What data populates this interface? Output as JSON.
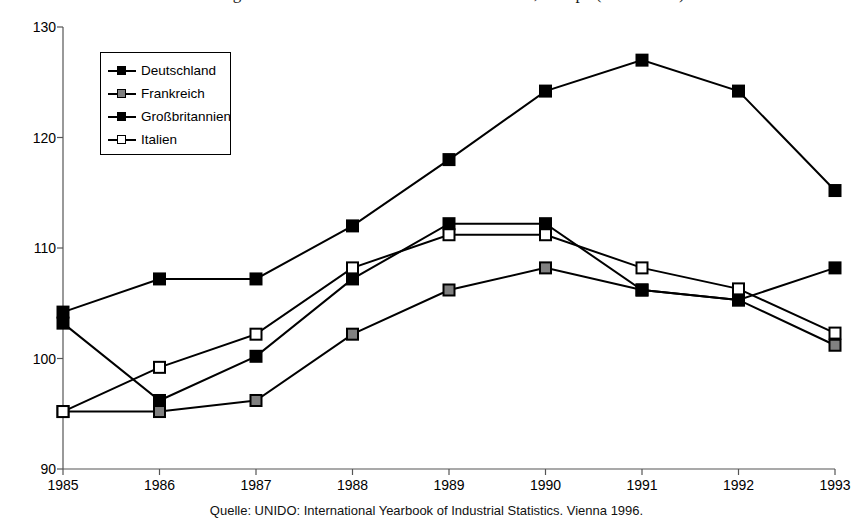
{
  "title": "Abbildung: Lohnstückkosten in der Gesamtwirtschaft, Europa (1985 = 100)",
  "source_note": "Quelle: UNIDO: International Yearbook of Industrial Statistics. Vienna 1996.",
  "legend": {
    "position": "top-left-inside",
    "entries": [
      {
        "label": "Deutschland",
        "marker": "filled-square",
        "color": "#000000"
      },
      {
        "label": "Frankreich",
        "marker": "gray-square",
        "color": "#808080"
      },
      {
        "label": "Großbritannien",
        "marker": "filled-square",
        "color": "#000000"
      },
      {
        "label": "Italien",
        "marker": "open-square",
        "color": "#ffffff"
      }
    ]
  },
  "chart_data": {
    "type": "line",
    "title": "Abbildung: Lohnstückkosten in der Gesamtwirtschaft, Europa (1985 = 100)",
    "xlabel": "",
    "ylabel": "",
    "x": [
      "1985",
      "1986",
      "1987",
      "1988",
      "1989",
      "1990",
      "1991",
      "1992",
      "1993"
    ],
    "categories": [
      "1985",
      "1986",
      "1987",
      "1988",
      "1989",
      "1990",
      "1991",
      "1992",
      "1993"
    ],
    "ylim": [
      90,
      130
    ],
    "yticks": [
      90,
      100,
      110,
      120,
      130
    ],
    "xlim": [
      "1985",
      "1993"
    ],
    "grid": false,
    "legend_position": "upper left",
    "series": [
      {
        "name": "Deutschland",
        "marker": "filled-square",
        "color": "#000000",
        "values": [
          104.2,
          107.2,
          107.2,
          112.0,
          118.0,
          124.2,
          127.0,
          124.2,
          115.2
        ]
      },
      {
        "name": "Frankreich",
        "marker": "gray-square",
        "color": "#808080",
        "values": [
          95.2,
          95.2,
          96.2,
          102.2,
          106.2,
          108.2,
          106.2,
          105.3,
          101.2
        ]
      },
      {
        "name": "Großbritannien",
        "marker": "filled-square",
        "color": "#000000",
        "values": [
          103.2,
          96.2,
          100.2,
          107.2,
          112.2,
          112.2,
          106.2,
          105.3,
          108.2
        ]
      },
      {
        "name": "Italien",
        "marker": "open-square",
        "color": "#ffffff",
        "values": [
          95.2,
          99.2,
          102.2,
          108.2,
          111.2,
          111.2,
          108.2,
          106.3,
          102.3
        ]
      }
    ]
  }
}
